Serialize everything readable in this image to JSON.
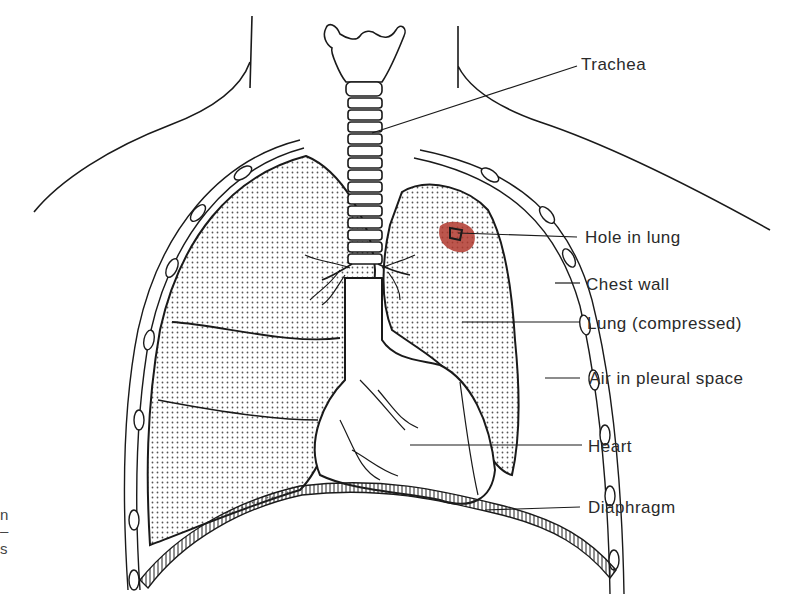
{
  "figure": {
    "labels": [
      {
        "id": "trachea",
        "text": "Trachea"
      },
      {
        "id": "hole-in-lung",
        "text": "Hole in lung"
      },
      {
        "id": "chest-wall",
        "text": "Chest wall"
      },
      {
        "id": "lung-compressed",
        "text": "Lung (compressed)"
      },
      {
        "id": "air-in-pleural-space",
        "text": "Air in pleural space"
      },
      {
        "id": "heart",
        "text": "Heart"
      },
      {
        "id": "diaphragm",
        "text": "Diaphragm"
      }
    ],
    "caption_fragments": [
      "n",
      "–",
      "s"
    ],
    "colors": {
      "line": "#1a1a1a",
      "stipple": "#555555",
      "hole": "#b0382e",
      "text": "#2a2a2a"
    }
  }
}
